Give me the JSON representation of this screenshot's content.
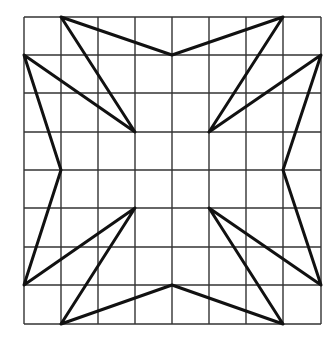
{
  "diagram": {
    "type": "grid-figure",
    "grid": {
      "cols": 8,
      "rows": 8,
      "x_lines": [
        24,
        61,
        98,
        135,
        172,
        209,
        246,
        283,
        321
      ],
      "y_lines": [
        17,
        55,
        93,
        132,
        170,
        208,
        247,
        285,
        324
      ],
      "line_color": "#333333",
      "line_width": 1.4
    },
    "shape": {
      "stroke_color": "#111111",
      "stroke_width": 3,
      "polyline_grid_points": [
        [
          1,
          0
        ],
        [
          4,
          1
        ],
        [
          7,
          0
        ],
        [
          5,
          3
        ],
        [
          8,
          1
        ],
        [
          7,
          4
        ],
        [
          8,
          7
        ],
        [
          5,
          5
        ],
        [
          7,
          8
        ],
        [
          4,
          7
        ],
        [
          1,
          8
        ],
        [
          3,
          5
        ],
        [
          0,
          7
        ],
        [
          1,
          4
        ],
        [
          0,
          1
        ],
        [
          3,
          3
        ],
        [
          1,
          0
        ]
      ]
    }
  }
}
